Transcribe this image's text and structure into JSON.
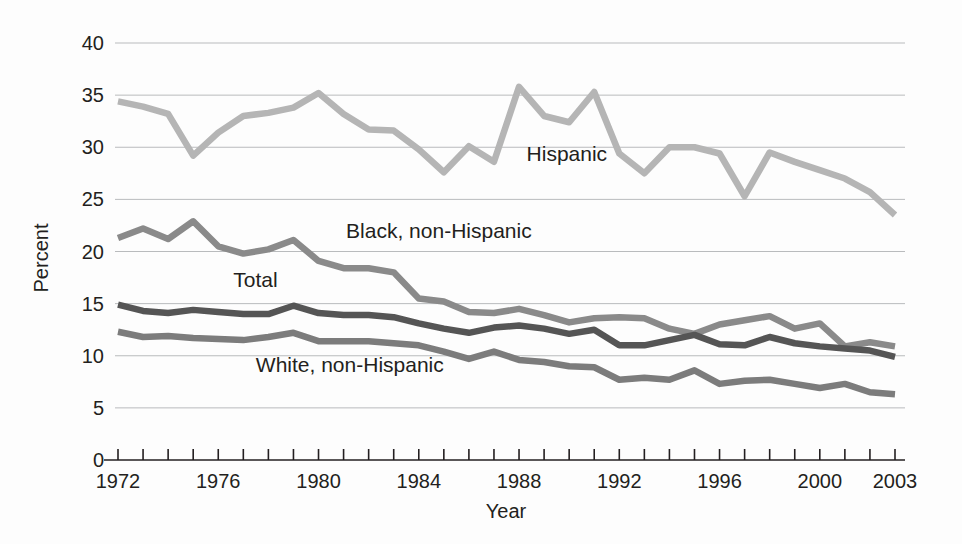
{
  "chart_data": {
    "type": "line",
    "title": "",
    "xlabel": "Year",
    "ylabel": "Percent",
    "xlim": [
      1972,
      2003
    ],
    "ylim": [
      0,
      40
    ],
    "grid": true,
    "legend_position": "inline-annotations",
    "x": [
      1972,
      1973,
      1974,
      1975,
      1976,
      1977,
      1978,
      1979,
      1980,
      1981,
      1982,
      1983,
      1984,
      1985,
      1986,
      1987,
      1988,
      1989,
      1990,
      1991,
      1992,
      1993,
      1994,
      1995,
      1996,
      1997,
      1998,
      1999,
      2000,
      2001,
      2002,
      2003
    ],
    "y_ticks": [
      0,
      5,
      10,
      15,
      20,
      25,
      30,
      35,
      40
    ],
    "x_tick_labels": [
      "1972",
      "1976",
      "1980",
      "1984",
      "1988",
      "1992",
      "1996",
      "2000",
      "2003"
    ],
    "x_tick_values": [
      1972,
      1976,
      1980,
      1984,
      1988,
      1992,
      1996,
      2000,
      2003
    ],
    "series": [
      {
        "name": "Hispanic",
        "color": "#b5b5b5",
        "label_x": 1988.3,
        "label_y": 28.7,
        "values": [
          34.4,
          33.9,
          33.2,
          29.2,
          31.4,
          33.0,
          33.3,
          33.8,
          35.2,
          33.2,
          31.7,
          31.6,
          29.8,
          27.6,
          30.1,
          28.6,
          35.8,
          33.0,
          32.4,
          35.3,
          29.4,
          27.5,
          30.0,
          30.0,
          29.4,
          25.3,
          29.5,
          28.6,
          27.8,
          27.0,
          25.7,
          23.5
        ]
      },
      {
        "name": "Black, non-Hispanic",
        "color": "#8a8a8a",
        "label_x": 1981.1,
        "label_y": 21.3,
        "values": [
          21.3,
          22.2,
          21.2,
          22.9,
          20.5,
          19.8,
          20.2,
          21.1,
          19.1,
          18.4,
          18.4,
          18.0,
          15.5,
          15.2,
          14.2,
          14.1,
          14.5,
          13.9,
          13.2,
          13.6,
          13.7,
          13.6,
          12.6,
          12.1,
          13.0,
          13.4,
          13.8,
          12.6,
          13.1,
          10.9,
          11.3,
          10.9
        ]
      },
      {
        "name": "Total",
        "color": "#555555",
        "label_x": 1976.6,
        "label_y": 16.6,
        "values": [
          14.9,
          14.3,
          14.1,
          14.4,
          14.2,
          14.0,
          14.0,
          14.8,
          14.1,
          13.9,
          13.9,
          13.7,
          13.1,
          12.6,
          12.2,
          12.7,
          12.9,
          12.6,
          12.1,
          12.5,
          11.0,
          11.0,
          11.5,
          12.0,
          11.1,
          11.0,
          11.8,
          11.2,
          10.9,
          10.7,
          10.5,
          9.9
        ]
      },
      {
        "name": "White, non-Hispanic",
        "color": "#7c7c7c",
        "label_x": 1977.5,
        "label_y": 8.4,
        "values": [
          12.3,
          11.8,
          11.9,
          11.7,
          11.6,
          11.5,
          11.8,
          12.2,
          11.4,
          11.4,
          11.4,
          11.2,
          11.0,
          10.4,
          9.7,
          10.4,
          9.6,
          9.4,
          9.0,
          8.9,
          7.7,
          7.9,
          7.7,
          8.6,
          7.3,
          7.6,
          7.7,
          7.3,
          6.9,
          7.3,
          6.5,
          6.3
        ]
      }
    ]
  },
  "axis": {
    "y_label": "Percent",
    "x_label": "Year"
  }
}
